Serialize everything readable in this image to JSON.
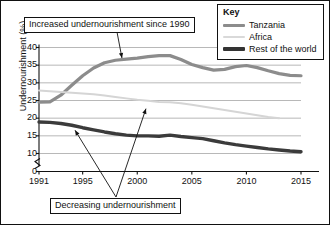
{
  "chart_data": {
    "type": "line",
    "title": "",
    "xlabel": "",
    "ylabel": "Undernourishment (%)",
    "xlim": [
      1991,
      2015
    ],
    "ylim": [
      0,
      40
    ],
    "y_axis_break": true,
    "y_break_between": [
      0,
      10
    ],
    "grid": true,
    "grid_axis": "y",
    "legend_position": "top-right",
    "xticks": [
      "1991",
      "1995",
      "2000",
      "2005",
      "2010",
      "2015"
    ],
    "xtick_values": [
      1991,
      1995,
      2000,
      2005,
      2010,
      2015
    ],
    "yticks": [
      "0",
      "10",
      "15",
      "20",
      "25",
      "30",
      "35",
      "40"
    ],
    "ytick_values": [
      0,
      10,
      15,
      20,
      25,
      30,
      35,
      40
    ],
    "x": [
      1991,
      1992,
      1993,
      1994,
      1995,
      1996,
      1997,
      1998,
      1999,
      2000,
      2001,
      2002,
      2003,
      2004,
      2005,
      2006,
      2007,
      2008,
      2009,
      2010,
      2011,
      2012,
      2013,
      2014,
      2015
    ],
    "series": [
      {
        "name": "Tanzania",
        "color": "#8c8c8c",
        "width": 3.2,
        "values": [
          24.5,
          24.6,
          26.5,
          29.3,
          32.0,
          34.2,
          35.7,
          36.4,
          36.7,
          37.0,
          37.4,
          37.7,
          37.7,
          36.6,
          35.2,
          34.3,
          33.6,
          33.8,
          34.6,
          34.9,
          34.3,
          33.4,
          32.6,
          32.1,
          32.0
        ]
      },
      {
        "name": "Africa",
        "color": "#d5d5d5",
        "width": 2.0,
        "values": [
          27.8,
          27.6,
          27.4,
          27.2,
          27.0,
          26.8,
          26.4,
          26.0,
          25.6,
          25.2,
          24.9,
          24.6,
          24.5,
          24.2,
          23.8,
          23.3,
          22.8,
          22.3,
          21.8,
          21.3,
          20.8,
          20.3,
          20.0,
          null,
          null
        ]
      },
      {
        "name": "Rest of the world",
        "color": "#3b3b3b",
        "width": 3.4,
        "values": [
          18.9,
          18.8,
          18.5,
          18.0,
          17.3,
          16.7,
          16.1,
          15.6,
          15.2,
          15.0,
          15.0,
          14.9,
          15.2,
          14.8,
          14.5,
          14.2,
          13.6,
          13.0,
          12.5,
          12.1,
          11.7,
          11.3,
          11.0,
          10.7,
          10.5
        ]
      }
    ],
    "annotations": [
      {
        "id": "increased",
        "text": "Increased undernourishment since 1990",
        "points_to": {
          "x": 1998.6,
          "y": 36.6
        }
      },
      {
        "id": "decreasing-africa",
        "text": "Decreasing undernourishment",
        "points_to": {
          "x": 2000.8,
          "y": 23.4
        }
      },
      {
        "id": "decreasing-rest",
        "text": "Decreasing undernourishment",
        "points_to": {
          "x": 1994.3,
          "y": 17.3
        }
      }
    ]
  },
  "legend": {
    "title": "Key",
    "items": [
      {
        "label": "Tanzania",
        "color": "#8c8c8c",
        "thickness": "3px"
      },
      {
        "label": "Africa",
        "color": "#d9d9d9",
        "thickness": "2px"
      },
      {
        "label": "Rest of the world",
        "color": "#333333",
        "thickness": "4px"
      }
    ]
  },
  "callouts": {
    "top": "Increased undernourishment since 1990",
    "bottom": "Decreasing undernourishment"
  },
  "axes": {
    "y_title": "Undernourishment (%)"
  }
}
